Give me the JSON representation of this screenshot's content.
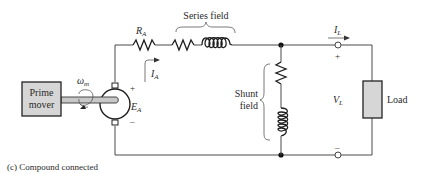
{
  "diagram": {
    "caption": "(c) Compound connected",
    "prime_mover": {
      "line1": "Prime",
      "line2": "mover"
    },
    "omega": {
      "main": "ω",
      "sub": "m"
    },
    "generator": {
      "ea_main": "E",
      "ea_sub": "A",
      "plus": "+",
      "minus": "–"
    },
    "ra": {
      "main": "R",
      "sub": "A"
    },
    "ia": {
      "main": "I",
      "sub": "A"
    },
    "series_field": "Series field",
    "shunt_field": {
      "line1": "Shunt",
      "line2": "field"
    },
    "il": {
      "main": "I",
      "sub": "L"
    },
    "vl": {
      "main": "V",
      "sub": "L"
    },
    "terminal_plus": "+",
    "terminal_minus": "–",
    "load": "Load",
    "colors": {
      "wire": "#4a4a4a",
      "box_fill": "#d6d6d6",
      "shaft_fill": "#c8c8c8",
      "text": "#2a2a2a"
    }
  }
}
